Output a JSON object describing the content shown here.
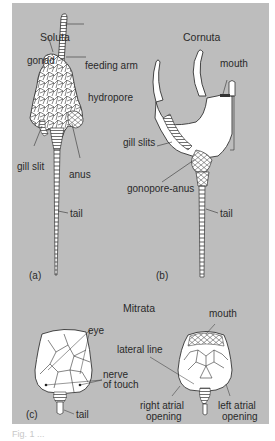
{
  "figure": {
    "background_color": "#bdbdbd",
    "ink_color": "#2a2a2a",
    "fill_color": "#ffffff",
    "panels": [
      {
        "id": "a",
        "tag": "(a)",
        "title": "Soluta",
        "labels": [
          "gonad",
          "feeding arm",
          "hydropore",
          "gill slit",
          "anus",
          "tail"
        ]
      },
      {
        "id": "b",
        "tag": "(b)",
        "title": "Cornuta",
        "labels": [
          "mouth",
          "gill slits",
          "gonopore-anus",
          "tail"
        ]
      },
      {
        "id": "c",
        "tag": "(c)",
        "title": "Mitrata",
        "labels": [
          "eye",
          "nerve",
          "of touch",
          "tail",
          "mouth",
          "lateral line",
          "right atrial",
          "opening",
          "left atrial",
          "opening"
        ]
      }
    ],
    "caption": "Fig. 1 ..."
  }
}
